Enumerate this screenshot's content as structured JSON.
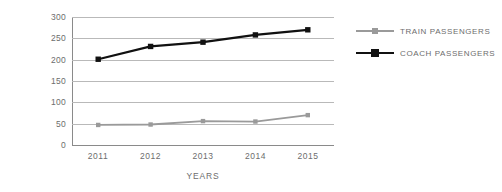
{
  "chart_data": {
    "type": "line",
    "title": "",
    "xlabel": "YEARS",
    "ylabel": "PASSENGERS (Millions)",
    "categories": [
      "2011",
      "2012",
      "2013",
      "2014",
      "2015"
    ],
    "ylim": [
      0,
      300
    ],
    "yticks": [
      0,
      50,
      100,
      150,
      200,
      250,
      300
    ],
    "ytick_labels": [
      "0",
      "50",
      "100",
      "150",
      "200",
      "250",
      "300"
    ],
    "grid": true,
    "legend_position": "right",
    "series": [
      {
        "name": "TRAIN PASSENGERS",
        "color": "#9a9a9a",
        "marker": "square",
        "values": [
          47,
          48,
          56,
          55,
          70
        ]
      },
      {
        "name": "COACH PASSENGERS",
        "color": "#111111",
        "marker": "square",
        "values": [
          201,
          231,
          241,
          258,
          270
        ]
      }
    ]
  },
  "axes": {
    "y_title": "PASSENGERS (Millions)",
    "x_title": "YEARS"
  },
  "colors": {
    "train": "#9a9a9a",
    "coach": "#111111",
    "grid": "#b9b9b9",
    "axis": "#8a8a8a",
    "text": "#6d6d6d",
    "background": "#ffffff"
  }
}
